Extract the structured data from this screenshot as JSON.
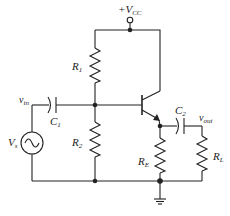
{
  "diagram": {
    "labels": {
      "vcc": {
        "prefix": "+V",
        "sub": "CC"
      },
      "r1": {
        "main": "R",
        "sub": "1"
      },
      "r2": {
        "main": "R",
        "sub": "2"
      },
      "re": {
        "main": "R",
        "sub": "E"
      },
      "rl": {
        "main": "R",
        "sub": "L"
      },
      "c1": {
        "main": "C",
        "sub": "1"
      },
      "c2": {
        "main": "C",
        "sub": "2"
      },
      "vin": {
        "main": "v",
        "sub": "in"
      },
      "vout": {
        "main": "v",
        "sub": "out"
      },
      "vs": {
        "main": "V",
        "sub": "s"
      }
    },
    "components": [
      "R1",
      "R2",
      "RE",
      "RL",
      "C1",
      "C2",
      "NPN transistor",
      "AC source Vs",
      "Ground",
      "+VCC supply"
    ],
    "colors": {
      "stroke": "#222222",
      "background": "#ffffff"
    }
  }
}
